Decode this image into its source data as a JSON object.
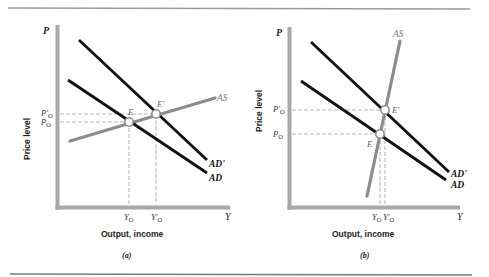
{
  "figure": {
    "rule_color": "#9a9a9a",
    "axis_color": "#a8a8a8",
    "ad_color": "#111111",
    "as_color": "#8c8c8c",
    "guide_color": "#b5b5b5"
  },
  "panels": [
    {
      "id": "a",
      "caption": "(a)",
      "y_axis_symbol": "P",
      "x_axis_symbol": "Y",
      "y_axis_title": "Price level",
      "x_axis_title": "Output, income",
      "curves": {
        "as_label": "AS",
        "ad_label": "AD",
        "ad_prime_label": "AD'"
      },
      "points": {
        "e_label": "E",
        "e_prime_label": "E'"
      },
      "ticks": {
        "p0": "P",
        "p0_sub": "O",
        "p0_prime": "P'",
        "p0_prime_sub": "O",
        "y0": "Y",
        "y0_sub": "O",
        "y0_prime": "Y'",
        "y0_prime_sub": "O"
      },
      "description": "Flat (elastic) AS curve: shift of AD to AD' raises output substantially (Y0 to Y'0) with a small price rise (P0 to P'0)."
    },
    {
      "id": "b",
      "caption": "(b)",
      "y_axis_symbol": "P",
      "x_axis_symbol": "Y",
      "y_axis_title": "Price level",
      "x_axis_title": "Output, income",
      "curves": {
        "as_label": "AS",
        "ad_label": "AD",
        "ad_prime_label": "AD'"
      },
      "points": {
        "e_label": "E",
        "e_prime_label": "E'"
      },
      "ticks": {
        "p0": "P",
        "p0_sub": "O",
        "p0_prime": "P'",
        "p0_prime_sub": "O",
        "y0": "Y",
        "y0_sub": "O",
        "y0_prime": "Y'",
        "y0_prime_sub": "O"
      },
      "description": "Steep (inelastic) AS curve: shift of AD to AD' mainly raises the price level (P0 to P'0) with little change in output (Y0 to Y'0)."
    }
  ]
}
